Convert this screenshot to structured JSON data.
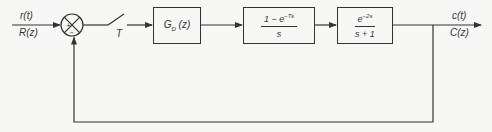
{
  "diagram": {
    "type": "sampled-data feedback control block diagram",
    "input": {
      "time_label": "r(t)",
      "z_label": "R(z)"
    },
    "summing_junction": {
      "plus_sign": "+",
      "minus_sign": "−"
    },
    "sampler": {
      "label": "T"
    },
    "blocks": [
      {
        "id": "controller",
        "label_main": "G",
        "label_sub": "D",
        "label_arg": "(z)"
      },
      {
        "id": "zoh",
        "numerator_prefix": "1 − e",
        "numerator_exp": "−Ts",
        "denominator": "s"
      },
      {
        "id": "plant",
        "numerator_base": "e",
        "numerator_exp": "−2s",
        "denominator": "s + 1"
      }
    ],
    "output": {
      "time_label": "c(t)",
      "z_label": "C(z)"
    },
    "feedback": {
      "type": "unity"
    }
  }
}
